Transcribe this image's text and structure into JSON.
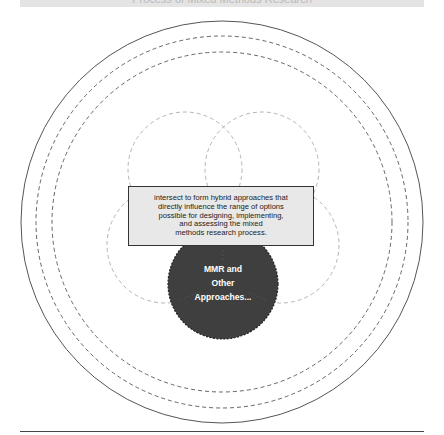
{
  "header": {
    "title_fragment": "Process of Mixed Methods Research"
  },
  "diagram": {
    "outer_rings": [
      {
        "r": 201,
        "style": "solid"
      },
      {
        "r": 186,
        "style": "dashed"
      },
      {
        "r": 170,
        "style": "dashed"
      }
    ],
    "petals": [
      {
        "name": "top-left",
        "cx": 185,
        "cy": 169,
        "r": 57
      },
      {
        "name": "top-right",
        "cx": 262,
        "cy": 169,
        "r": 57
      },
      {
        "name": "bottom-left",
        "cx": 165,
        "cy": 245,
        "r": 58
      },
      {
        "name": "bottom-right",
        "cx": 281,
        "cy": 245,
        "r": 58
      }
    ],
    "center_box": {
      "lines": [
        "intersect to form hybrid approaches that",
        "directly influence the range of options",
        "possible for designing, implementing,",
        "and assessing the mixed",
        "methods research process."
      ]
    },
    "core_circle": {
      "lines": [
        "MMR and",
        "Other",
        "Approaches..."
      ]
    },
    "colors": {
      "ring": "#555555",
      "petal": "#b5b5b5",
      "core_fill": "#3f3f3f",
      "box_fill": "#e8e8e8",
      "box_border": "#333333"
    }
  }
}
